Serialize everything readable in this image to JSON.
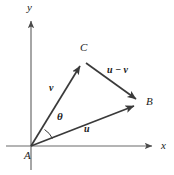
{
  "figure": {
    "type": "vector-triangle-diagram",
    "width": 174,
    "height": 175,
    "background_color": "#ffffff",
    "stroke_color": "#3a3a3a",
    "text_color": "#1a1a1a"
  },
  "axes": {
    "x_label": "x",
    "y_label": "y",
    "origin_label": "A",
    "origin": [
      31,
      146
    ],
    "x_axis_end": [
      158,
      146
    ],
    "y_axis_end": [
      31,
      14
    ]
  },
  "points": {
    "A": {
      "label": "A",
      "x": 31,
      "y": 146
    },
    "B": {
      "label": "B",
      "x": 141,
      "y": 103
    },
    "C": {
      "label": "C",
      "x": 84,
      "y": 61
    }
  },
  "vectors": [
    {
      "name": "v",
      "label": "v",
      "from": "A",
      "to": "C",
      "label_x": 50,
      "label_y": 85
    },
    {
      "name": "u",
      "label": "u",
      "from": "A",
      "to": "B",
      "label_x": 84,
      "label_y": 125
    },
    {
      "name": "u-minus-v",
      "label": "u − v",
      "from": "C",
      "to": "B",
      "label_x": 108,
      "label_y": 66
    }
  ],
  "angle": {
    "label": "θ",
    "label_x": 56,
    "label_y": 112,
    "between": [
      "u",
      "v"
    ],
    "vertex": "A"
  }
}
